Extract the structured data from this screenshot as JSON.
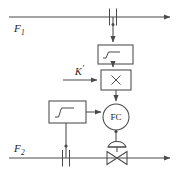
{
  "diagram": {
    "stroke_color": "#4a4a4a",
    "text_color": "#1a1a1a",
    "background": "#ffffff",
    "streams": [
      {
        "id": "stream-1",
        "label": "F",
        "subscript": "1",
        "direction": "left-to-right",
        "y": 17
      },
      {
        "id": "stream-2",
        "label": "F",
        "subscript": "2",
        "direction": "left-to-right",
        "y": 158
      }
    ],
    "elements": {
      "orifice_top": {
        "name": "orifice-plate-f1",
        "x": 113,
        "y": 17
      },
      "orifice_bottom": {
        "name": "orifice-plate-f2",
        "x": 66,
        "y": 158
      },
      "sqrt_block_top": {
        "label": "√",
        "semantic": "square-root-extractor",
        "x": 98,
        "y": 45,
        "w": 35,
        "h": 19
      },
      "sqrt_block_bottom": {
        "label": "√",
        "semantic": "square-root-extractor",
        "x": 49,
        "y": 101,
        "w": 37,
        "h": 22
      },
      "multiplier": {
        "label": "×",
        "semantic": "multiplier-block",
        "x": 101,
        "y": 70,
        "w": 30,
        "h": 20
      },
      "controller": {
        "label": "FC",
        "semantic": "flow-controller",
        "cx": 116,
        "cy": 117,
        "r": 13
      },
      "control_valve": {
        "semantic": "diaphragm-control-valve",
        "cx": 117,
        "cy": 158
      }
    },
    "setpoint": {
      "label": "K",
      "prime": "′",
      "name": "ratio-gain-setpoint"
    }
  }
}
